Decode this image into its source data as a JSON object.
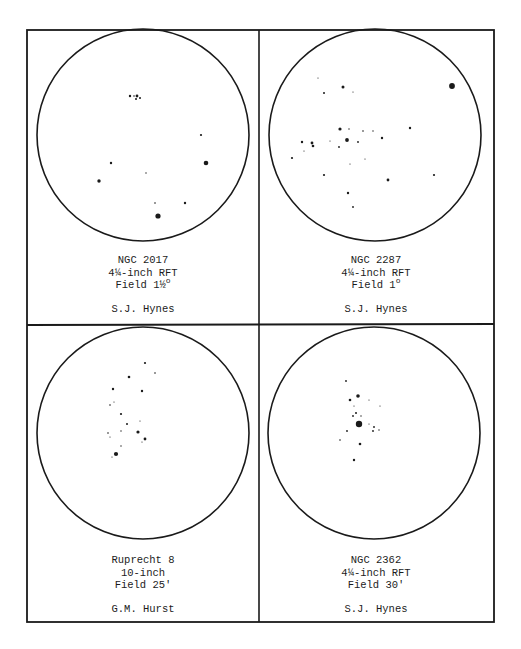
{
  "page": {
    "colors": {
      "ink": "#1a1a1a",
      "paper": "#ffffff"
    }
  },
  "panels": [
    {
      "object": "NGC 2017",
      "instrument": "4¼-inch RFT",
      "field": "Field 1½",
      "field_unit": "o",
      "observer": "S.J. Hynes",
      "circle": {
        "cx": 143,
        "cy": 135,
        "r": 106
      },
      "stars": [
        [
          130,
          96,
          1.2
        ],
        [
          137,
          96,
          1.4
        ],
        [
          140,
          98,
          1.0
        ],
        [
          136,
          99,
          1.0
        ],
        [
          134,
          96,
          0.8
        ],
        [
          201,
          135,
          1.1
        ],
        [
          206,
          163,
          2.3
        ],
        [
          111,
          163,
          1.2
        ],
        [
          146,
          173,
          0.7
        ],
        [
          99,
          181,
          1.7
        ],
        [
          155,
          203,
          0.8
        ],
        [
          185,
          203,
          1.2
        ],
        [
          158,
          216,
          2.6
        ]
      ]
    },
    {
      "object": "NGC 2287",
      "instrument": "4¼-inch RFT",
      "field": "Field 1",
      "field_unit": "o",
      "observer": "S.J. Hynes",
      "circle": {
        "cx": 375,
        "cy": 135,
        "r": 106
      },
      "stars": [
        [
          452,
          86,
          2.9
        ],
        [
          318,
          78,
          0.6
        ],
        [
          343,
          87,
          1.5
        ],
        [
          324,
          93,
          1.0
        ],
        [
          353,
          92,
          0.6
        ],
        [
          340,
          129,
          1.6
        ],
        [
          349,
          129,
          0.7
        ],
        [
          363,
          131,
          0.8
        ],
        [
          373,
          131,
          0.7
        ],
        [
          410,
          128,
          1.2
        ],
        [
          382,
          138,
          1.2
        ],
        [
          347,
          140,
          1.9
        ],
        [
          358,
          142,
          0.9
        ],
        [
          302,
          142,
          1.2
        ],
        [
          312,
          143,
          1.4
        ],
        [
          313,
          146,
          1.3
        ],
        [
          330,
          141,
          0.6
        ],
        [
          339,
          147,
          0.9
        ],
        [
          304,
          151,
          0.6
        ],
        [
          292,
          158,
          1.1
        ],
        [
          365,
          159,
          0.6
        ],
        [
          350,
          164,
          0.6
        ],
        [
          324,
          175,
          1.1
        ],
        [
          434,
          175,
          1.1
        ],
        [
          388,
          180,
          1.4
        ],
        [
          348,
          193,
          1.2
        ],
        [
          353,
          207,
          0.9
        ]
      ]
    },
    {
      "object": "Ruprecht 8",
      "instrument": "10-inch",
      "field": "Field 25'",
      "field_unit": "",
      "observer": "G.M. Hurst",
      "circle": {
        "cx": 143,
        "cy": 433,
        "r": 106
      },
      "stars": [
        [
          145,
          363,
          1.1
        ],
        [
          155,
          373,
          0.8
        ],
        [
          129,
          377,
          1.3
        ],
        [
          113,
          389,
          1.2
        ],
        [
          142,
          391,
          1.2
        ],
        [
          110,
          405,
          0.8
        ],
        [
          114,
          402,
          0.6
        ],
        [
          121,
          414,
          1.1
        ],
        [
          127,
          424,
          1.0
        ],
        [
          140,
          421,
          0.6
        ],
        [
          121,
          431,
          0.7
        ],
        [
          108,
          433,
          0.8
        ],
        [
          110,
          437,
          0.6
        ],
        [
          138,
          432,
          1.6
        ],
        [
          145,
          439,
          1.4
        ],
        [
          142,
          442,
          0.6
        ],
        [
          121,
          446,
          0.7
        ],
        [
          116,
          454,
          2.1
        ],
        [
          112,
          457,
          0.6
        ]
      ]
    },
    {
      "object": "NGC 2362",
      "instrument": "4¼-inch RFT",
      "field": "Field 30'",
      "field_unit": "",
      "observer": "S.J. Hynes",
      "circle": {
        "cx": 374,
        "cy": 433,
        "r": 106
      },
      "stars": [
        [
          346,
          381,
          0.9
        ],
        [
          358,
          396,
          1.8
        ],
        [
          350,
          400,
          1.3
        ],
        [
          369,
          400,
          0.6
        ],
        [
          380,
          406,
          0.6
        ],
        [
          354,
          406,
          0.6
        ],
        [
          356,
          413,
          1.0
        ],
        [
          353,
          416,
          0.9
        ],
        [
          361,
          416,
          0.7
        ],
        [
          359,
          424,
          3.2
        ],
        [
          369,
          424,
          0.6
        ],
        [
          374,
          427,
          0.9
        ],
        [
          373,
          431,
          0.9
        ],
        [
          379,
          430,
          0.7
        ],
        [
          347,
          431,
          0.9
        ],
        [
          340,
          440,
          0.8
        ],
        [
          360,
          444,
          1.3
        ],
        [
          354,
          460,
          1.2
        ]
      ]
    }
  ]
}
